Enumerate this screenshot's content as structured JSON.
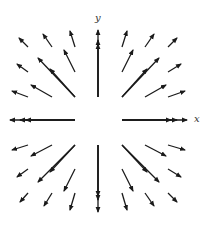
{
  "diagram": {
    "type": "vector-field",
    "axis_labels": {
      "x": "x",
      "y": "y"
    },
    "origin_px": [
      98.5,
      120
    ],
    "arrow_color": "#1a1a1a",
    "arrows": [
      {
        "from": [
          28,
          47
        ],
        "to": [
          19,
          38
        ]
      },
      {
        "from": [
          52,
          47
        ],
        "to": [
          43,
          34
        ]
      },
      {
        "from": [
          75,
          47
        ],
        "to": [
          70,
          31
        ]
      },
      {
        "from": [
          122,
          47
        ],
        "to": [
          127,
          31
        ]
      },
      {
        "from": [
          145,
          47
        ],
        "to": [
          154,
          34
        ]
      },
      {
        "from": [
          168,
          47
        ],
        "to": [
          177,
          38
        ]
      },
      {
        "from": [
          28,
          72
        ],
        "to": [
          17,
          64
        ]
      },
      {
        "from": [
          75,
          72
        ],
        "to": [
          64,
          50
        ]
      },
      {
        "from": [
          122,
          72
        ],
        "to": [
          133,
          50
        ]
      },
      {
        "from": [
          168,
          72
        ],
        "to": [
          181,
          64
        ]
      },
      {
        "from": [
          28,
          97
        ],
        "to": [
          12,
          91
        ]
      },
      {
        "from": [
          52,
          97
        ],
        "to": [
          31,
          85
        ]
      },
      {
        "from": [
          75,
          97
        ],
        "to": [
          38,
          58
        ]
      },
      {
        "from": [
          75,
          97
        ],
        "to": [
          50,
          69
        ]
      },
      {
        "from": [
          122,
          97
        ],
        "to": [
          159,
          58
        ]
      },
      {
        "from": [
          122,
          97
        ],
        "to": [
          147,
          69
        ]
      },
      {
        "from": [
          145,
          97
        ],
        "to": [
          166,
          85
        ]
      },
      {
        "from": [
          168,
          97
        ],
        "to": [
          185,
          91
        ]
      },
      {
        "from": [
          98,
          97
        ],
        "to": [
          98,
          30
        ]
      },
      {
        "from": [
          98,
          97
        ],
        "to": [
          98,
          40
        ]
      },
      {
        "from": [
          98,
          97
        ],
        "to": [
          98,
          44
        ]
      },
      {
        "from": [
          75,
          120
        ],
        "to": [
          10,
          120
        ]
      },
      {
        "from": [
          75,
          120
        ],
        "to": [
          20,
          120
        ]
      },
      {
        "from": [
          75,
          120
        ],
        "to": [
          26,
          120
        ]
      },
      {
        "from": [
          122,
          120
        ],
        "to": [
          187,
          120
        ]
      },
      {
        "from": [
          122,
          120
        ],
        "to": [
          177,
          120
        ]
      },
      {
        "from": [
          122,
          120
        ],
        "to": [
          171,
          120
        ]
      },
      {
        "from": [
          28,
          145
        ],
        "to": [
          12,
          150
        ]
      },
      {
        "from": [
          52,
          145
        ],
        "to": [
          31,
          156
        ]
      },
      {
        "from": [
          75,
          145
        ],
        "to": [
          38,
          182
        ]
      },
      {
        "from": [
          75,
          145
        ],
        "to": [
          50,
          172
        ]
      },
      {
        "from": [
          122,
          145
        ],
        "to": [
          159,
          182
        ]
      },
      {
        "from": [
          122,
          145
        ],
        "to": [
          147,
          172
        ]
      },
      {
        "from": [
          145,
          145
        ],
        "to": [
          166,
          156
        ]
      },
      {
        "from": [
          168,
          145
        ],
        "to": [
          185,
          150
        ]
      },
      {
        "from": [
          98,
          145
        ],
        "to": [
          98,
          212
        ]
      },
      {
        "from": [
          98,
          145
        ],
        "to": [
          98,
          200
        ]
      },
      {
        "from": [
          98,
          145
        ],
        "to": [
          98,
          196
        ]
      },
      {
        "from": [
          28,
          169
        ],
        "to": [
          17,
          177
        ]
      },
      {
        "from": [
          75,
          169
        ],
        "to": [
          64,
          191
        ]
      },
      {
        "from": [
          122,
          169
        ],
        "to": [
          133,
          191
        ]
      },
      {
        "from": [
          168,
          169
        ],
        "to": [
          181,
          177
        ]
      },
      {
        "from": [
          28,
          193
        ],
        "to": [
          20,
          202
        ]
      },
      {
        "from": [
          52,
          193
        ],
        "to": [
          44,
          206
        ]
      },
      {
        "from": [
          75,
          193
        ],
        "to": [
          70,
          210
        ]
      },
      {
        "from": [
          122,
          193
        ],
        "to": [
          127,
          210
        ]
      },
      {
        "from": [
          145,
          193
        ],
        "to": [
          154,
          206
        ]
      },
      {
        "from": [
          168,
          193
        ],
        "to": [
          177,
          202
        ]
      }
    ]
  }
}
